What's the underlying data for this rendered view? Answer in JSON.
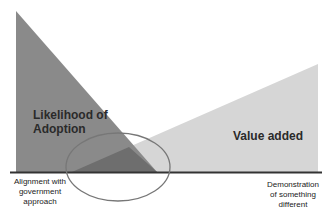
{
  "diagram": {
    "shapes": {
      "likelihood_triangle": {
        "label": "Likelihood of Adoption",
        "line1": "Likelihood of",
        "line2": "Adoption",
        "color": "#8a8a8a"
      },
      "value_triangle": {
        "label": "Value added",
        "color": "#d6d6d6"
      },
      "overlap_color": "#6e6e6e",
      "ellipse_stroke": "#777777",
      "baseline_color": "#333333"
    },
    "axis_labels": {
      "left": {
        "line1": "Alignment with",
        "line2": "government",
        "line3": "approach"
      },
      "right": {
        "line1": "Demonstration",
        "line2": "of something",
        "line3": "different"
      }
    }
  }
}
